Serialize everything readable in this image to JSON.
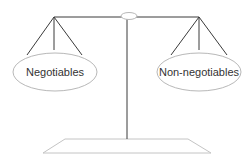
{
  "diagram": {
    "type": "balance-scale",
    "left_pan": {
      "label": "Negotiables"
    },
    "right_pan": {
      "label": "Non-negotiables"
    }
  },
  "colors": {
    "line": "#3a3a3a",
    "outline": "#b8b8b8",
    "text": "#333333",
    "background": "#ffffff"
  }
}
